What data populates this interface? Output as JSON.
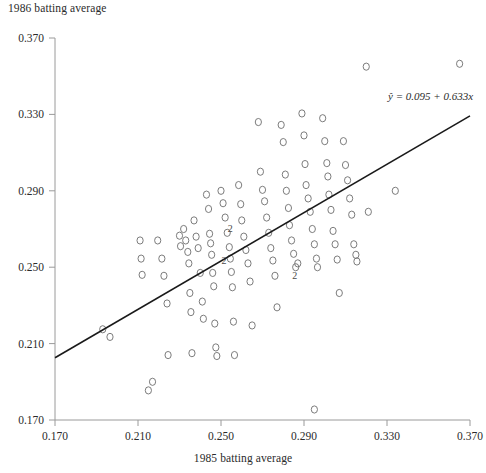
{
  "chart_data": {
    "type": "scatter",
    "title": "",
    "ylabel": "1986 batting average",
    "xlabel": "1985 batting average",
    "xlim": [
      0.17,
      0.37
    ],
    "ylim": [
      0.17,
      0.37
    ],
    "xticks": [
      "0.170",
      "0.210",
      "0.250",
      "0.290",
      "0.330",
      "0.370"
    ],
    "yticks": [
      "0.370",
      "0.330",
      "0.290",
      "0.250",
      "0.210",
      "0.170"
    ],
    "xtick_values": [
      0.17,
      0.21,
      0.25,
      0.29,
      0.33,
      0.37
    ],
    "ytick_values": [
      0.37,
      0.33,
      0.29,
      0.25,
      0.21,
      0.17
    ],
    "grid": false,
    "legend": null,
    "annotations": [
      {
        "name": "regression-equation",
        "text": "ŷ = 0.095 + 0.633x",
        "x": 0.33,
        "y": 0.3355
      }
    ],
    "fit_line": {
      "name": "least-squares-regression-line",
      "equation": "ŷ = 0.095 + 0.633x",
      "intercept": 0.095,
      "slope": 0.633,
      "x_start": 0.17,
      "y_start": 0.2026,
      "x_end": 0.37,
      "y_end": 0.3292
    },
    "marker_style": "open-circle",
    "duplicate_marker_label": "2",
    "points": [
      [
        0.193,
        0.2175
      ],
      [
        0.1965,
        0.2135
      ],
      [
        0.211,
        0.264
      ],
      [
        0.2115,
        0.2545
      ],
      [
        0.212,
        0.246
      ],
      [
        0.215,
        0.1855
      ],
      [
        0.217,
        0.19
      ],
      [
        0.2195,
        0.264
      ],
      [
        0.2215,
        0.2545
      ],
      [
        0.2225,
        0.2455
      ],
      [
        0.224,
        0.231
      ],
      [
        0.2245,
        0.204
      ],
      [
        0.23,
        0.2665
      ],
      [
        0.2305,
        0.261
      ],
      [
        0.232,
        0.27
      ],
      [
        0.233,
        0.264
      ],
      [
        0.234,
        0.258
      ],
      [
        0.2345,
        0.252
      ],
      [
        0.235,
        0.2365
      ],
      [
        0.2355,
        0.2265
      ],
      [
        0.236,
        0.205
      ],
      [
        0.237,
        0.2745
      ],
      [
        0.238,
        0.266
      ],
      [
        0.239,
        0.26
      ],
      [
        0.24,
        0.247
      ],
      [
        0.241,
        0.232
      ],
      [
        0.2415,
        0.223
      ],
      [
        0.243,
        0.288
      ],
      [
        0.244,
        0.2805
      ],
      [
        0.2445,
        0.2675
      ],
      [
        0.245,
        0.2625
      ],
      [
        0.2455,
        0.2565
      ],
      [
        0.246,
        0.247
      ],
      [
        0.2465,
        0.24
      ],
      [
        0.247,
        0.2205
      ],
      [
        0.2475,
        0.208
      ],
      [
        0.248,
        0.2035
      ],
      [
        0.25,
        0.29
      ],
      [
        0.251,
        0.2835
      ],
      [
        0.252,
        0.276
      ],
      [
        0.253,
        0.268
      ],
      [
        0.254,
        0.2605
      ],
      [
        0.2545,
        0.2545
      ],
      [
        0.255,
        0.2475
      ],
      [
        0.2555,
        0.2395
      ],
      [
        0.256,
        0.2215
      ],
      [
        0.2565,
        0.204
      ],
      [
        0.2585,
        0.293
      ],
      [
        0.2595,
        0.283
      ],
      [
        0.26,
        0.2745
      ],
      [
        0.261,
        0.266
      ],
      [
        0.262,
        0.259
      ],
      [
        0.263,
        0.252
      ],
      [
        0.264,
        0.2425
      ],
      [
        0.265,
        0.2195
      ],
      [
        0.268,
        0.326
      ],
      [
        0.269,
        0.3
      ],
      [
        0.27,
        0.2905
      ],
      [
        0.271,
        0.2845
      ],
      [
        0.272,
        0.276
      ],
      [
        0.273,
        0.268
      ],
      [
        0.274,
        0.26
      ],
      [
        0.275,
        0.2535
      ],
      [
        0.276,
        0.2455
      ],
      [
        0.277,
        0.229
      ],
      [
        0.279,
        0.3245
      ],
      [
        0.28,
        0.3155
      ],
      [
        0.281,
        0.2985
      ],
      [
        0.2815,
        0.29
      ],
      [
        0.2825,
        0.281
      ],
      [
        0.283,
        0.272
      ],
      [
        0.284,
        0.264
      ],
      [
        0.285,
        0.257
      ],
      [
        0.286,
        0.25
      ],
      [
        0.287,
        0.252
      ],
      [
        0.289,
        0.3305
      ],
      [
        0.29,
        0.319
      ],
      [
        0.2905,
        0.304
      ],
      [
        0.291,
        0.293
      ],
      [
        0.292,
        0.286
      ],
      [
        0.293,
        0.279
      ],
      [
        0.294,
        0.27
      ],
      [
        0.295,
        0.262
      ],
      [
        0.296,
        0.2545
      ],
      [
        0.2965,
        0.25
      ],
      [
        0.295,
        0.1755
      ],
      [
        0.299,
        0.328
      ],
      [
        0.3,
        0.316
      ],
      [
        0.301,
        0.3045
      ],
      [
        0.3015,
        0.2975
      ],
      [
        0.302,
        0.288
      ],
      [
        0.303,
        0.28
      ],
      [
        0.304,
        0.269
      ],
      [
        0.305,
        0.262
      ],
      [
        0.306,
        0.254
      ],
      [
        0.307,
        0.2365
      ],
      [
        0.309,
        0.316
      ],
      [
        0.31,
        0.3035
      ],
      [
        0.311,
        0.2955
      ],
      [
        0.312,
        0.286
      ],
      [
        0.313,
        0.2775
      ],
      [
        0.314,
        0.262
      ],
      [
        0.315,
        0.2565
      ],
      [
        0.3155,
        0.253
      ],
      [
        0.32,
        0.355
      ],
      [
        0.321,
        0.279
      ],
      [
        0.334,
        0.29
      ],
      [
        0.365,
        0.3565
      ]
    ],
    "duplicate_points": [
      [
        0.2545,
        0.2705
      ],
      [
        0.2515,
        0.2535
      ],
      [
        0.2855,
        0.2455
      ]
    ]
  }
}
